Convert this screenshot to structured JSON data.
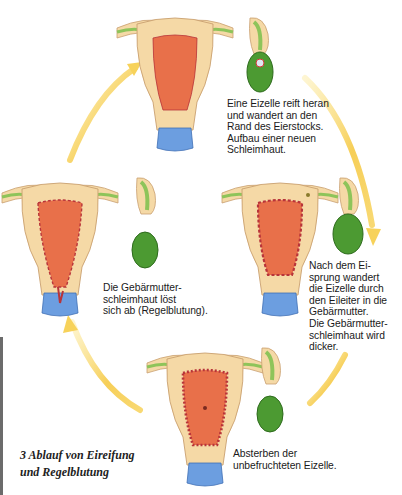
{
  "figure": {
    "title_number": "3",
    "caption_line1": "3  Ablauf von Eireifung",
    "caption_line2": "und Regelblutung",
    "colors": {
      "arrow": "#f6c840",
      "uterus_wall": "#f5d9a6",
      "endometrium": "#e8704a",
      "endometrium_thick": "#b8343a",
      "tube": "#8ec45a",
      "ovary": "#4c9a32",
      "cervix": "#5b8fd6"
    }
  },
  "stages": [
    {
      "id": "stage-1",
      "position": "top",
      "text": "Eine Eizelle reift heran\nund wandert an den\nRand des Eierstocks.\nAufbau einer neuen\nSchleimhaut."
    },
    {
      "id": "stage-2",
      "position": "right",
      "text": "Nach dem Ei-\nsprung wandert\ndie Eizelle durch\nden Eileiter in die\nGebärmutter.\nDie Gebärmutter-\nschleimhaut wird\ndicker."
    },
    {
      "id": "stage-3",
      "position": "bottom",
      "text": "Absterben der\nunbefruchteten Eizelle."
    },
    {
      "id": "stage-4",
      "position": "left",
      "text": "Die Gebärmutter-\nschleimhaut löst\nsich ab (Regelblutung)."
    }
  ]
}
